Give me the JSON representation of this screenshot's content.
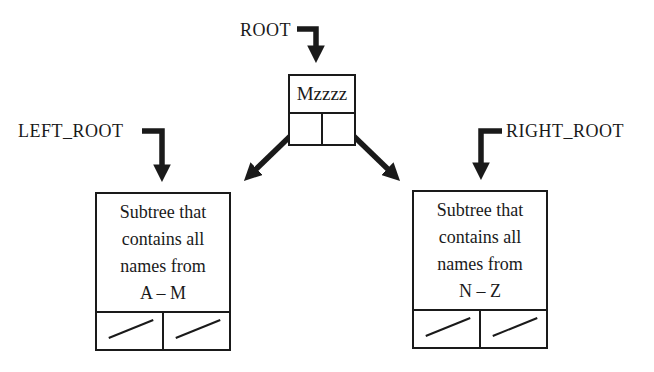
{
  "labels": {
    "root": "ROOT",
    "left_root": "LEFT_ROOT",
    "right_root": "RIGHT_ROOT"
  },
  "root_node": {
    "value": "Mzzzz"
  },
  "left_subtree": {
    "lines": [
      "Subtree that",
      "contains all",
      "names from",
      "A – M"
    ]
  },
  "right_subtree": {
    "lines": [
      "Subtree that",
      "contains all",
      "names from",
      "N – Z"
    ]
  },
  "colors": {
    "ink": "#1a1a1a",
    "background": "#ffffff"
  }
}
